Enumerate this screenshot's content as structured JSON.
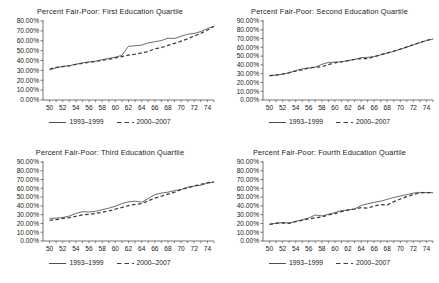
{
  "figure": {
    "panel_count": 4,
    "background_color": "#ffffff",
    "line_color": "#3b3b3b"
  },
  "legend": {
    "series1_label": "1993–1999",
    "series2_label": "2000–2007",
    "series1_style": "solid",
    "series2_style": "dashed"
  },
  "chart_data": [
    {
      "type": "line",
      "title": "Percent Fair-Poor: First Education Quartile",
      "xlabel": "",
      "ylabel": "",
      "xlim": [
        49,
        75
      ],
      "ylim": [
        0,
        80
      ],
      "grid": false,
      "legend_position": "bottom",
      "ytick_labels": [
        "0.00%",
        "10.00%",
        "20.00%",
        "30.00%",
        "40.00%",
        "50.00%",
        "60.00%",
        "70.00%",
        "80.00%"
      ],
      "ytick_values": [
        0,
        10,
        20,
        30,
        40,
        50,
        60,
        70,
        80
      ],
      "xtick_labels": [
        "50",
        "52",
        "54",
        "56",
        "58",
        "60",
        "62",
        "64",
        "66",
        "68",
        "70",
        "72",
        "74"
      ],
      "xtick_values": [
        50,
        52,
        54,
        56,
        58,
        60,
        62,
        64,
        66,
        68,
        70,
        72,
        74
      ],
      "x": [
        50,
        51,
        52,
        53,
        54,
        55,
        56,
        57,
        58,
        59,
        60,
        61,
        62,
        63,
        64,
        65,
        66,
        67,
        68,
        69,
        70,
        71,
        72,
        73,
        74,
        75
      ],
      "series": [
        {
          "name": "1993–1999",
          "style": "solid",
          "values": [
            30.5,
            32.6,
            34.0,
            34.8,
            36.2,
            37.6,
            38.6,
            39.4,
            40.8,
            42.2,
            43.4,
            45.2,
            54.4,
            54.9,
            55.6,
            57.8,
            59.0,
            60.2,
            62.6,
            62.3,
            64.6,
            66.6,
            67.5,
            69.3,
            72.5,
            74.5
          ]
        },
        {
          "name": "2000–2007",
          "style": "dashed",
          "values": [
            31.4,
            33.0,
            33.9,
            34.6,
            36.0,
            37.0,
            38.2,
            39.0,
            40.2,
            41.2,
            42.6,
            44.0,
            45.4,
            46.4,
            47.8,
            49.2,
            51.8,
            53.0,
            55.3,
            57.3,
            59.6,
            62.0,
            64.8,
            67.5,
            70.8,
            74.8
          ]
        }
      ]
    },
    {
      "type": "line",
      "title": "Percent Fair-Poor: Second Education Quartile",
      "xlabel": "",
      "ylabel": "",
      "xlim": [
        49,
        75
      ],
      "ylim": [
        0,
        90
      ],
      "grid": false,
      "legend_position": "bottom",
      "ytick_labels": [
        "0.00%",
        "10.00%",
        "20.00%",
        "30.00%",
        "40.00%",
        "50.00%",
        "60.00%",
        "70.00%",
        "80.00%",
        "90.00%"
      ],
      "ytick_values": [
        0,
        10,
        20,
        30,
        40,
        50,
        60,
        70,
        80,
        90
      ],
      "xtick_labels": [
        "50",
        "52",
        "54",
        "56",
        "58",
        "60",
        "62",
        "64",
        "66",
        "68",
        "70",
        "72",
        "74"
      ],
      "xtick_values": [
        50,
        52,
        54,
        56,
        58,
        60,
        62,
        64,
        66,
        68,
        70,
        72,
        74
      ],
      "x": [
        50,
        51,
        52,
        53,
        54,
        55,
        56,
        57,
        58,
        59,
        60,
        61,
        62,
        63,
        64,
        65,
        66,
        67,
        68,
        69,
        70,
        71,
        72,
        73,
        74,
        75
      ],
      "series": [
        {
          "name": "1993–1999",
          "style": "solid",
          "values": [
            27.4,
            28.2,
            29.4,
            30.8,
            33.6,
            35.5,
            36.2,
            37.4,
            40.6,
            42.8,
            43.2,
            43.6,
            44.8,
            46.2,
            48.3,
            48.6,
            49.4,
            51.4,
            53.4,
            55.4,
            57.8,
            60.2,
            62.8,
            65.2,
            67.8,
            69.4
          ]
        },
        {
          "name": "2000–2007",
          "style": "dashed",
          "values": [
            27.8,
            28.6,
            29.6,
            31.2,
            33.0,
            34.2,
            36.8,
            37.4,
            37.9,
            40.4,
            42.4,
            43.4,
            44.9,
            46.2,
            47.2,
            47.0,
            49.4,
            51.5,
            53.6,
            55.6,
            58.0,
            60.6,
            63.0,
            65.6,
            67.9,
            69.6
          ]
        }
      ]
    },
    {
      "type": "line",
      "title": "Percent Fair-Poor: Third Education Quartile",
      "xlabel": "",
      "ylabel": "",
      "xlim": [
        49,
        75
      ],
      "ylim": [
        0,
        90
      ],
      "grid": false,
      "legend_position": "bottom",
      "ytick_labels": [
        "0.00%",
        "10.00%",
        "20.00%",
        "30.00%",
        "40.00%",
        "50.00%",
        "60.00%",
        "70.00%",
        "80.00%",
        "90.00%"
      ],
      "ytick_values": [
        0,
        10,
        20,
        30,
        40,
        50,
        60,
        70,
        80,
        90
      ],
      "xtick_labels": [
        "50",
        "52",
        "54",
        "56",
        "58",
        "60",
        "62",
        "64",
        "66",
        "68",
        "70",
        "72",
        "74"
      ],
      "xtick_values": [
        50,
        52,
        54,
        56,
        58,
        60,
        62,
        64,
        66,
        68,
        70,
        72,
        74
      ],
      "x": [
        50,
        51,
        52,
        53,
        54,
        55,
        56,
        57,
        58,
        59,
        60,
        61,
        62,
        63,
        64,
        65,
        66,
        67,
        68,
        69,
        70,
        71,
        72,
        73,
        74,
        75
      ],
      "series": [
        {
          "name": "1993–1999",
          "style": "solid",
          "values": [
            25.8,
            26.0,
            26.8,
            28.4,
            31.4,
            33.4,
            33.0,
            33.8,
            35.6,
            37.4,
            39.6,
            42.6,
            44.6,
            45.4,
            44.2,
            48.4,
            52.8,
            54.6,
            55.6,
            57.4,
            58.6,
            61.4,
            62.6,
            63.6,
            65.8,
            67.2
          ]
        },
        {
          "name": "2000–2007",
          "style": "dashed",
          "values": [
            23.4,
            24.4,
            25.8,
            26.6,
            28.2,
            29.8,
            30.4,
            31.4,
            32.8,
            34.2,
            36.2,
            38.2,
            40.4,
            41.8,
            42.6,
            45.8,
            48.8,
            51.0,
            53.4,
            55.6,
            58.6,
            60.6,
            62.8,
            64.6,
            66.4,
            67.4
          ]
        }
      ]
    },
    {
      "type": "line",
      "title": "Percent Fair-Poor: Fourth Education Quartile",
      "xlabel": "",
      "ylabel": "",
      "xlim": [
        49,
        75
      ],
      "ylim": [
        0,
        90
      ],
      "grid": false,
      "legend_position": "bottom",
      "ytick_labels": [
        "0.00%",
        "10.00%",
        "20.00%",
        "30.00%",
        "40.00%",
        "50.00%",
        "60.00%",
        "70.00%",
        "80.00%",
        "90.00%"
      ],
      "ytick_values": [
        0,
        10,
        20,
        30,
        40,
        50,
        60,
        70,
        80,
        90
      ],
      "xtick_labels": [
        "50",
        "52",
        "54",
        "56",
        "58",
        "60",
        "62",
        "64",
        "66",
        "68",
        "70",
        "72",
        "74"
      ],
      "xtick_values": [
        50,
        52,
        54,
        56,
        58,
        60,
        62,
        64,
        66,
        68,
        70,
        72,
        74
      ],
      "x": [
        50,
        51,
        52,
        53,
        54,
        55,
        56,
        57,
        58,
        59,
        60,
        61,
        62,
        63,
        64,
        65,
        66,
        67,
        68,
        69,
        70,
        71,
        72,
        73,
        74,
        75
      ],
      "series": [
        {
          "name": "1993–1999",
          "style": "solid",
          "values": [
            19.2,
            20.4,
            21.0,
            20.4,
            22.4,
            24.2,
            26.4,
            29.6,
            28.6,
            30.4,
            32.4,
            34.6,
            35.4,
            36.4,
            40.4,
            42.4,
            44.0,
            45.4,
            47.4,
            49.6,
            51.2,
            52.8,
            54.6,
            55.4,
            55.2,
            55.0
          ]
        },
        {
          "name": "2000–2007",
          "style": "dashed",
          "values": [
            19.0,
            20.0,
            20.6,
            20.2,
            22.0,
            23.6,
            25.2,
            26.4,
            27.4,
            29.6,
            31.2,
            33.4,
            35.2,
            36.4,
            38.0,
            37.4,
            40.0,
            41.4,
            41.0,
            44.8,
            47.8,
            50.6,
            53.0,
            54.8,
            55.2,
            55.0
          ]
        }
      ]
    }
  ]
}
